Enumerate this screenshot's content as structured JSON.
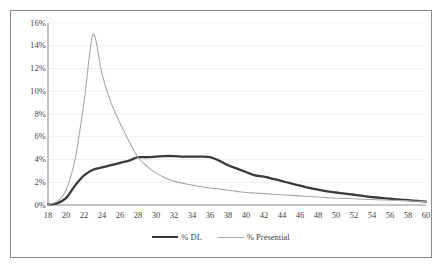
{
  "chart_data": {
    "type": "line",
    "title": "",
    "subtitle": "",
    "xlabel": "",
    "ylabel": "",
    "xlim": [
      18,
      60
    ],
    "ylim": [
      0,
      16
    ],
    "grid": true,
    "grid_axis": "y",
    "legend_position": "bottom",
    "y_tick_labels": [
      "0%",
      "2%",
      "4%",
      "6%",
      "8%",
      "10%",
      "12%",
      "14%",
      "16%"
    ],
    "y_tick_values": [
      0,
      2,
      4,
      6,
      8,
      10,
      12,
      14,
      16
    ],
    "x_tick_labels": [
      "18",
      "20",
      "22",
      "24",
      "26",
      "28",
      "30",
      "32",
      "34",
      "36",
      "38",
      "40",
      "42",
      "44",
      "46",
      "48",
      "50",
      "52",
      "54",
      "56",
      "58",
      "60"
    ],
    "x_tick_values": [
      18,
      20,
      22,
      24,
      26,
      28,
      30,
      32,
      34,
      36,
      38,
      40,
      42,
      44,
      46,
      48,
      50,
      52,
      54,
      56,
      58,
      60
    ],
    "x": [
      18,
      19,
      20,
      21,
      22,
      23,
      24,
      25,
      26,
      27,
      28,
      29,
      30,
      31,
      32,
      33,
      34,
      35,
      36,
      37,
      38,
      39,
      40,
      41,
      42,
      43,
      44,
      45,
      46,
      47,
      48,
      49,
      50,
      51,
      52,
      53,
      54,
      55,
      56,
      57,
      58,
      59,
      60
    ],
    "series": [
      {
        "name": "% DL",
        "color": "#3a3a3a",
        "width": 2.3,
        "values": [
          0.05,
          0.15,
          0.6,
          1.7,
          2.6,
          3.1,
          3.3,
          3.5,
          3.7,
          3.9,
          4.2,
          4.2,
          4.25,
          4.3,
          4.3,
          4.25,
          4.25,
          4.25,
          4.2,
          3.9,
          3.5,
          3.2,
          2.9,
          2.6,
          2.5,
          2.3,
          2.1,
          1.9,
          1.7,
          1.5,
          1.35,
          1.2,
          1.1,
          1.0,
          0.9,
          0.8,
          0.7,
          0.62,
          0.55,
          0.48,
          0.42,
          0.36,
          0.3
        ]
      },
      {
        "name": "% Presential",
        "color": "#a9a9a9",
        "width": 1.1,
        "values": [
          0.05,
          0.3,
          1.3,
          4.0,
          9.0,
          15.0,
          11.5,
          9.0,
          7.2,
          5.6,
          4.2,
          3.4,
          2.8,
          2.4,
          2.1,
          1.9,
          1.75,
          1.6,
          1.5,
          1.4,
          1.3,
          1.2,
          1.1,
          1.05,
          1.0,
          0.95,
          0.9,
          0.85,
          0.8,
          0.75,
          0.7,
          0.65,
          0.6,
          0.58,
          0.55,
          0.5,
          0.48,
          0.45,
          0.42,
          0.4,
          0.37,
          0.33,
          0.3
        ]
      }
    ],
    "legend": [
      {
        "label": "% DL",
        "style": "dl"
      },
      {
        "label": "% Presential",
        "style": "pres"
      }
    ]
  }
}
